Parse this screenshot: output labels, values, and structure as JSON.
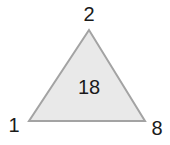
{
  "diagram": {
    "type": "number-triangle-puzzle",
    "center_value": "18",
    "vertices": {
      "top": "2",
      "bottom_left": "1",
      "bottom_right": "8"
    },
    "colors": {
      "fill": "#e9e9e9",
      "stroke": "#a3a3a3",
      "text": "#1a1a1a"
    }
  }
}
